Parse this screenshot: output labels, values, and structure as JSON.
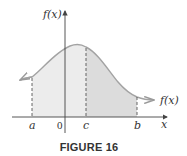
{
  "figure": {
    "caption": "FIGURE 16",
    "y_axis_label": "f(x)",
    "x_axis_label": "x",
    "curve_label": "f(x)",
    "x_tick_labels": {
      "a": "a",
      "origin": "0",
      "c": "c",
      "b": "b"
    },
    "colors": {
      "curve": "#a3a3a3",
      "axis": "#444444",
      "region_a_to_c": "#ececec",
      "region_c_to_b": "#dcdcdc",
      "dashed_lines": "#555555",
      "text": "#333333"
    }
  }
}
